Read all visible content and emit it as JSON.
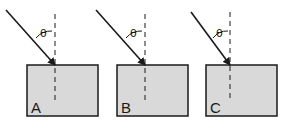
{
  "diagram": {
    "colors": {
      "background": "#ffffff",
      "block_fill": "#d9d9d9",
      "stroke": "#1a1a1a"
    },
    "angle_symbol": "θ",
    "panels": [
      {
        "label": "A",
        "rect": {
          "x": 27,
          "y": 65,
          "w": 71,
          "h": 51
        },
        "normal_x": 55,
        "ray_start": [
          6,
          10
        ],
        "theta_pos": [
          41,
          35
        ]
      },
      {
        "label": "B",
        "rect": {
          "x": 117,
          "y": 65,
          "w": 71,
          "h": 51
        },
        "normal_x": 144,
        "ray_start": [
          96,
          10
        ],
        "theta_pos": [
          131,
          35
        ]
      },
      {
        "label": "C",
        "rect": {
          "x": 206,
          "y": 65,
          "w": 71,
          "h": 51
        },
        "normal_x": 230,
        "ray_start": [
          191,
          10
        ],
        "theta_pos": [
          220,
          35
        ]
      }
    ]
  }
}
